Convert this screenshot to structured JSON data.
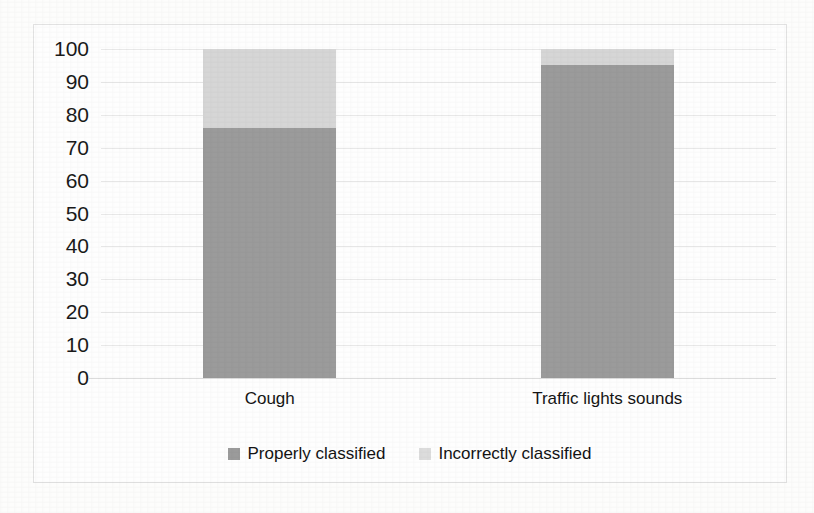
{
  "chart_data": {
    "type": "bar",
    "subtype": "stacked-column",
    "title": "",
    "xlabel": "",
    "ylabel": "",
    "categories": [
      "Cough",
      "Traffic lights sounds"
    ],
    "series": [
      {
        "name": "Properly classified",
        "color": "#9b9b9b",
        "values": [
          76,
          95
        ]
      },
      {
        "name": "Incorrectly classified",
        "color": "#d6d6d6",
        "values": [
          24,
          5
        ]
      }
    ],
    "ylim": [
      0,
      100
    ],
    "ytick_step": 10,
    "ytick_labels": [
      "100",
      "90",
      "80",
      "70",
      "60",
      "50",
      "40",
      "30",
      "20",
      "10",
      "0"
    ],
    "ytick_values": [
      100,
      90,
      80,
      70,
      60,
      50,
      40,
      30,
      20,
      10,
      0
    ],
    "grid": true,
    "grid_axis": "y",
    "legend_position": "bottom",
    "stacked_total": 100
  },
  "legend": {
    "items": [
      {
        "label": "Properly classified",
        "swatch": "properly"
      },
      {
        "label": "Incorrectly classified",
        "swatch": "incorrect"
      }
    ]
  },
  "colors": {
    "properly_classified": "#9b9b9b",
    "incorrectly_classified": "#d6d6d6",
    "gridline": "#e8e8e8",
    "axis": "#dcdcdc",
    "frame_border": "#e2e2e2",
    "text": "#141414",
    "background": "#fdfdfc"
  }
}
